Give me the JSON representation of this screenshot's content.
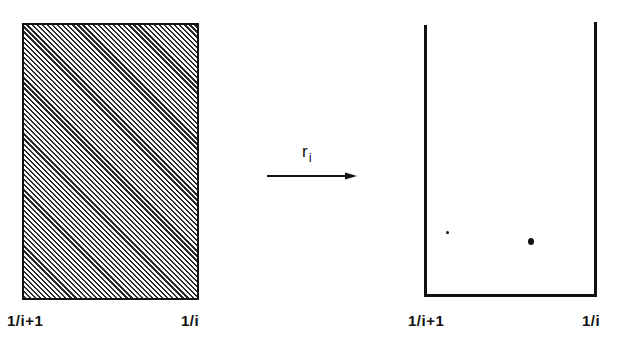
{
  "diagram": {
    "type": "mapping-illustration",
    "left_shape": {
      "kind": "hatched-rectangle",
      "fill": "diagonal-hatch",
      "labels": {
        "left": "1/i+1",
        "right": "1/i"
      }
    },
    "mapping": {
      "symbol": "r",
      "subscript": "i",
      "direction": "left-to-right"
    },
    "right_shape": {
      "kind": "open-top-box",
      "fill": "empty",
      "labels": {
        "left": "1/i+1",
        "right": "1/i"
      },
      "points": [
        {
          "size": "small",
          "x": 448,
          "y": 232
        },
        {
          "size": "large",
          "x": 531,
          "y": 242
        }
      ]
    },
    "colors": {
      "ink": "#111111",
      "background": "#ffffff"
    }
  }
}
